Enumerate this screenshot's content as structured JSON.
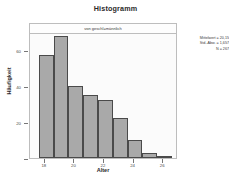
{
  "chart_data": {
    "type": "bar",
    "title": "Histogramm",
    "subtitle": "von geschl=männlich",
    "xlabel": "Alter",
    "ylabel": "Häufigkeit",
    "grid": false,
    "legend": "none",
    "xlim": [
      17.0,
      27.0
    ],
    "ylim": [
      0,
      70
    ],
    "xticks": [
      "18",
      "20",
      "22",
      "24",
      "26"
    ],
    "xtick_values": [
      18,
      20,
      22,
      24,
      26
    ],
    "yticks": [
      "0",
      "20",
      "40",
      "60"
    ],
    "ytick_values": [
      0,
      20,
      40,
      60
    ],
    "bin_width": 1.0,
    "bin_starts": [
      17.6,
      18.6,
      19.6,
      20.6,
      21.6,
      22.6,
      23.6,
      24.6,
      25.6
    ],
    "categories": [
      "18",
      "19",
      "20",
      "21",
      "22",
      "23",
      "24",
      "25",
      "26"
    ],
    "values": [
      57,
      68,
      40,
      35,
      32,
      22,
      10,
      3,
      1
    ],
    "bar_color": "#a9a9a9",
    "bar_edge_color": "#4a4a4a",
    "plot_background": "#fbfbfb",
    "frame_color": "#bdbdbd"
  },
  "statistics": {
    "mean_label": "Mittelwert = 20,15",
    "stddev_label": "Std.-Abw. = 1,657",
    "n_label": "N = 267",
    "mean": 20.15,
    "stddev": 1.657,
    "n": 267
  }
}
